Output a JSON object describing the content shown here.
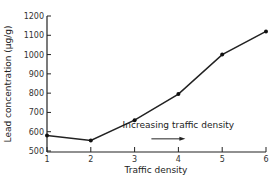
{
  "chart_data": {
    "type": "line",
    "title": "",
    "xlabel": "Traffic density",
    "ylabel": "Lead concentration (µg/g)",
    "x": [
      1,
      2,
      3,
      4,
      5,
      6
    ],
    "series": [
      {
        "name": "Lead concentration",
        "values": [
          580,
          555,
          660,
          795,
          1000,
          1120
        ]
      }
    ],
    "xticks": [
      "1",
      "2",
      "3",
      "4",
      "5",
      "6"
    ],
    "yticks": [
      "500",
      "600",
      "700",
      "800",
      "900",
      "1000",
      "1100",
      "1200"
    ],
    "ylim": [
      500,
      1200
    ],
    "xlim": [
      1,
      6
    ],
    "grid": false,
    "annotations": [
      {
        "text": "Increasing traffic density",
        "arrow": "right",
        "x": 4,
        "y": 620
      }
    ]
  }
}
